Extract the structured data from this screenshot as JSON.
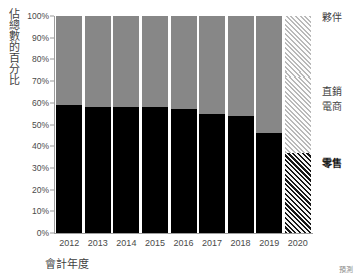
{
  "chart_data": {
    "type": "bar",
    "subtype": "100% stacked bar",
    "title": "",
    "xlabel": "會計年度",
    "ylabel": "佔總數的百分比",
    "categories": [
      "2012",
      "2013",
      "2014",
      "2015",
      "2016",
      "2017",
      "2018",
      "2019",
      "2020"
    ],
    "ylim": [
      0,
      100
    ],
    "ytick_labels": [
      "0%",
      "10%",
      "20%",
      "30%",
      "40%",
      "50%",
      "60%",
      "70%",
      "80%",
      "90%",
      "100%"
    ],
    "ytick_values": [
      0,
      10,
      20,
      30,
      40,
      50,
      60,
      70,
      80,
      90,
      100
    ],
    "grid": false,
    "legend_position": "right",
    "stack_order_bottom_to_top": [
      "零售",
      "電商",
      "直銷",
      "夥伴"
    ],
    "series": [
      {
        "name": "零售",
        "color": "#000000",
        "values": [
          59,
          58,
          58,
          58,
          57,
          55,
          54,
          46,
          37
        ]
      },
      {
        "name": "電商",
        "color": "#878787",
        "values": [
          22,
          22,
          22,
          22,
          22,
          24,
          25,
          30,
          35
        ]
      },
      {
        "name": "直銷",
        "color": "#878787",
        "values": [
          2,
          2,
          2,
          2,
          2,
          2,
          2,
          2,
          2
        ]
      },
      {
        "name": "夥伴",
        "color": "#878787",
        "values": [
          17,
          18,
          18,
          18,
          19,
          19,
          19,
          22,
          26
        ]
      }
    ],
    "annotations": [
      "預測"
    ],
    "forecast_categories": [
      "2020"
    ],
    "forecast_style": "hatched"
  },
  "axis": {
    "y_title": "佔總數的百分比",
    "x_title": "會計年度",
    "forecast_note": "預測"
  },
  "legend": {
    "items": [
      {
        "label": "夥伴",
        "emphasis": "normal"
      },
      {
        "label": "直銷",
        "emphasis": "normal"
      },
      {
        "label": "電商",
        "emphasis": "normal"
      },
      {
        "label": "零售",
        "emphasis": "bold"
      }
    ]
  }
}
